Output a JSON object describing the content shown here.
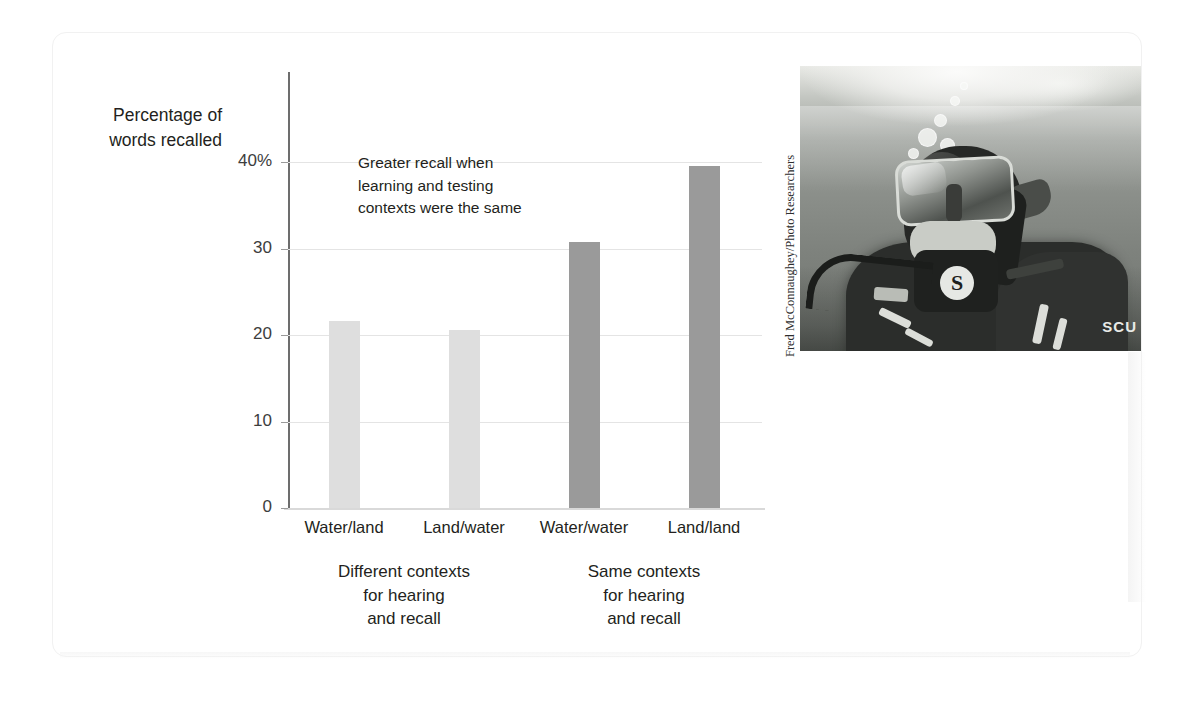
{
  "figure": {
    "y_axis_title": "Percentage of\nwords recalled",
    "annotation": "Greater recall when\nlearning and testing\ncontexts were the same",
    "photo_credit": "Fred McConnaughey/Photo Researchers",
    "photo_alt": "scuba-diver-underwater-photo",
    "photo_brand_text": "SCU"
  },
  "chart_data": {
    "type": "bar",
    "title": "",
    "xlabel": "",
    "ylabel": "Percentage of words recalled",
    "categories": [
      "Water/land",
      "Land/water",
      "Water/water",
      "Land/land"
    ],
    "values": [
      21.6,
      20.6,
      30.7,
      39.5
    ],
    "bar_colors": [
      "#dedede",
      "#dedede",
      "#9a9a9a",
      "#9a9a9a"
    ],
    "ylim": [
      0,
      44
    ],
    "yticks": [
      0,
      10,
      20,
      30,
      40
    ],
    "ytick_labels": [
      "0",
      "10",
      "20",
      "30",
      "40%"
    ],
    "grid": true,
    "grid_axis": "y",
    "legend": false,
    "groups": [
      {
        "label": "Different contexts\nfor hearing\nand recall",
        "categories": [
          "Water/land",
          "Land/water"
        ]
      },
      {
        "label": "Same contexts\nfor hearing\nand recall",
        "categories": [
          "Water/water",
          "Land/land"
        ]
      }
    ],
    "annotations": [
      {
        "text": "Greater recall when\nlearning and testing\ncontexts were the same"
      }
    ]
  }
}
